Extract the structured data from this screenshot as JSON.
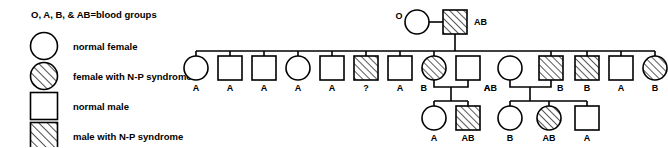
{
  "legend": {
    "heading": "O, A, B, & AB=blood groups",
    "items": [
      {
        "symbol": "circle-open",
        "label": "normal female"
      },
      {
        "symbol": "circle-hatched",
        "label": "female with N-P syndrome"
      },
      {
        "symbol": "square-open",
        "label": "normal male"
      },
      {
        "symbol": "square-hatched",
        "label": "male with N-P syndrome"
      }
    ]
  },
  "pedigree": {
    "generation_1": [
      {
        "id": "I-1",
        "sex": "female",
        "affected": false,
        "blood_group": "O",
        "label_side": "left"
      },
      {
        "id": "I-2",
        "sex": "male",
        "affected": true,
        "blood_group": "AB",
        "label_side": "right"
      }
    ],
    "generation_2": [
      {
        "id": "II-1",
        "sex": "female",
        "affected": false,
        "blood_group": "A"
      },
      {
        "id": "II-2",
        "sex": "male",
        "affected": false,
        "blood_group": "A"
      },
      {
        "id": "II-3",
        "sex": "male",
        "affected": false,
        "blood_group": "A"
      },
      {
        "id": "II-4",
        "sex": "female",
        "affected": false,
        "blood_group": "A"
      },
      {
        "id": "II-5",
        "sex": "male",
        "affected": false,
        "blood_group": "A"
      },
      {
        "id": "II-6",
        "sex": "male",
        "affected": true,
        "blood_group": "?"
      },
      {
        "id": "II-7",
        "sex": "male",
        "affected": false,
        "blood_group": "A"
      },
      {
        "id": "II-8",
        "sex": "female",
        "affected": true,
        "blood_group": "B"
      },
      {
        "id": "II-9",
        "sex": "male",
        "affected": false,
        "blood_group": "A",
        "married_in": true
      },
      {
        "id": "II-10",
        "sex": "female",
        "affected": false,
        "blood_group": "AB",
        "married_in": true
      },
      {
        "id": "II-11",
        "sex": "male",
        "affected": true,
        "blood_group": "B"
      },
      {
        "id": "II-12",
        "sex": "male",
        "affected": true,
        "blood_group": "B"
      },
      {
        "id": "II-13",
        "sex": "male",
        "affected": false,
        "blood_group": "A"
      },
      {
        "id": "II-14",
        "sex": "female",
        "affected": true,
        "blood_group": "B"
      }
    ],
    "generation_3": [
      {
        "id": "III-1",
        "sex": "female",
        "affected": false,
        "blood_group": "A"
      },
      {
        "id": "III-2",
        "sex": "male",
        "affected": true,
        "blood_group": "AB"
      },
      {
        "id": "III-3",
        "sex": "female",
        "affected": false,
        "blood_group": "B"
      },
      {
        "id": "III-4",
        "sex": "female",
        "affected": true,
        "blood_group": "AB"
      },
      {
        "id": "III-5",
        "sex": "male",
        "affected": false,
        "blood_group": "A"
      }
    ]
  }
}
